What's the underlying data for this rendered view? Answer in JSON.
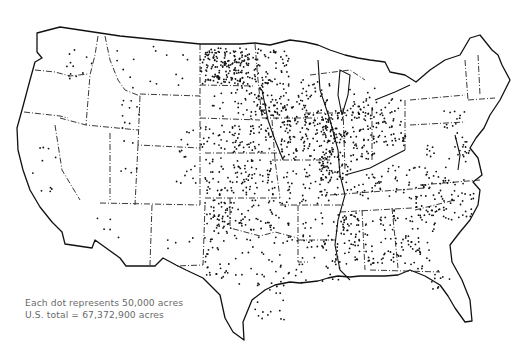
{
  "map": {
    "title": "",
    "subject": "Dot density map of the contiguous United States",
    "legend": {
      "line1": "Each dot represents 50,000 acres",
      "line2": "U.S. total = 67,372,900 acres"
    },
    "dot_value_acres": 50000,
    "total_acres": 67372900,
    "colors": {
      "background": "#ffffff",
      "outline": "#111111",
      "dot": "#111111",
      "legend_text": "#6a6a6a"
    },
    "density_regions": [
      {
        "name": "North Dakota (east)",
        "x": 200,
        "y": 48,
        "w": 60,
        "h": 36,
        "count": 150
      },
      {
        "name": "North Dakota (west)",
        "x": 205,
        "y": 50,
        "w": 30,
        "h": 30,
        "count": 40
      },
      {
        "name": "Minnesota (west)",
        "x": 255,
        "y": 50,
        "w": 35,
        "h": 70,
        "count": 85
      },
      {
        "name": "Minnesota (south)",
        "x": 265,
        "y": 95,
        "w": 45,
        "h": 30,
        "count": 45
      },
      {
        "name": "South Dakota (east)",
        "x": 235,
        "y": 85,
        "w": 30,
        "h": 35,
        "count": 40
      },
      {
        "name": "South Dakota (west)",
        "x": 205,
        "y": 88,
        "w": 30,
        "h": 30,
        "count": 8
      },
      {
        "name": "Nebraska (east)",
        "x": 232,
        "y": 125,
        "w": 40,
        "h": 30,
        "count": 55
      },
      {
        "name": "Nebraska (west)",
        "x": 200,
        "y": 125,
        "w": 32,
        "h": 25,
        "count": 22
      },
      {
        "name": "Kansas",
        "x": 205,
        "y": 158,
        "w": 70,
        "h": 38,
        "count": 95
      },
      {
        "name": "Iowa",
        "x": 280,
        "y": 120,
        "w": 55,
        "h": 40,
        "count": 115
      },
      {
        "name": "Missouri",
        "x": 283,
        "y": 165,
        "w": 55,
        "h": 40,
        "count": 60
      },
      {
        "name": "Illinois",
        "x": 318,
        "y": 110,
        "w": 30,
        "h": 70,
        "count": 110
      },
      {
        "name": "Indiana",
        "x": 350,
        "y": 112,
        "w": 25,
        "h": 50,
        "count": 60
      },
      {
        "name": "Ohio",
        "x": 376,
        "y": 98,
        "w": 30,
        "h": 50,
        "count": 55
      },
      {
        "name": "Wisconsin",
        "x": 300,
        "y": 75,
        "w": 30,
        "h": 40,
        "count": 30
      },
      {
        "name": "Michigan (lower)",
        "x": 350,
        "y": 85,
        "w": 25,
        "h": 35,
        "count": 25
      },
      {
        "name": "Oklahoma",
        "x": 210,
        "y": 200,
        "w": 80,
        "h": 30,
        "count": 75
      },
      {
        "name": "Texas (panhandle)",
        "x": 205,
        "y": 198,
        "w": 25,
        "h": 80,
        "count": 50
      },
      {
        "name": "Texas (central)",
        "x": 230,
        "y": 235,
        "w": 75,
        "h": 50,
        "count": 45
      },
      {
        "name": "Texas (south)",
        "x": 255,
        "y": 280,
        "w": 30,
        "h": 40,
        "count": 20
      },
      {
        "name": "Arkansas",
        "x": 300,
        "y": 208,
        "w": 45,
        "h": 40,
        "count": 30
      },
      {
        "name": "Louisiana",
        "x": 305,
        "y": 250,
        "w": 35,
        "h": 35,
        "count": 15
      },
      {
        "name": "Mississippi Delta",
        "x": 335,
        "y": 210,
        "w": 25,
        "h": 55,
        "count": 55
      },
      {
        "name": "Tennessee / Kentucky",
        "x": 345,
        "y": 165,
        "w": 75,
        "h": 35,
        "count": 55
      },
      {
        "name": "Alabama",
        "x": 365,
        "y": 210,
        "w": 30,
        "h": 55,
        "count": 45
      },
      {
        "name": "Georgia",
        "x": 395,
        "y": 215,
        "w": 40,
        "h": 55,
        "count": 55
      },
      {
        "name": "Carolinas",
        "x": 410,
        "y": 180,
        "w": 65,
        "h": 40,
        "count": 75
      },
      {
        "name": "Virginia / Maryland",
        "x": 425,
        "y": 145,
        "w": 45,
        "h": 35,
        "count": 25
      },
      {
        "name": "Pennsylvania",
        "x": 440,
        "y": 108,
        "w": 25,
        "h": 20,
        "count": 12
      },
      {
        "name": "Montana",
        "x": 110,
        "y": 45,
        "w": 80,
        "h": 45,
        "count": 16
      },
      {
        "name": "Washington (east)",
        "x": 65,
        "y": 45,
        "w": 30,
        "h": 35,
        "count": 12
      },
      {
        "name": "Idaho (south)",
        "x": 120,
        "y": 95,
        "w": 20,
        "h": 35,
        "count": 10
      },
      {
        "name": "Colorado (east)",
        "x": 175,
        "y": 130,
        "w": 30,
        "h": 55,
        "count": 18
      },
      {
        "name": "California (central)",
        "x": 32,
        "y": 130,
        "w": 25,
        "h": 70,
        "count": 10
      },
      {
        "name": "Arizona (south)",
        "x": 95,
        "y": 215,
        "w": 25,
        "h": 25,
        "count": 5
      },
      {
        "name": "New Mexico (east)",
        "x": 165,
        "y": 235,
        "w": 40,
        "h": 15,
        "count": 6
      },
      {
        "name": "Utah / Nevada",
        "x": 115,
        "y": 140,
        "w": 25,
        "h": 35,
        "count": 6
      },
      {
        "name": "Florida (north)",
        "x": 430,
        "y": 270,
        "w": 25,
        "h": 20,
        "count": 10
      },
      {
        "name": "Delmarva",
        "x": 455,
        "y": 130,
        "w": 15,
        "h": 25,
        "count": 12
      }
    ]
  }
}
